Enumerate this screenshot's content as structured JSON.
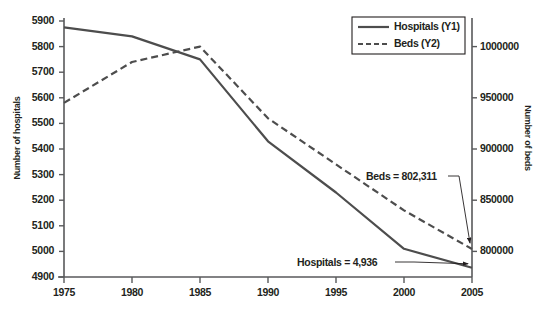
{
  "chart_data": {
    "type": "line",
    "title": "",
    "xlabel": "",
    "ylabel": "Number of hospitals",
    "ylabel_secondary": "Number of beds",
    "grid": false,
    "legend_position": "top-right",
    "x": [
      1975,
      1980,
      1985,
      1990,
      1995,
      2000,
      2005
    ],
    "xtick_labels": [
      "1975",
      "1980",
      "1985",
      "1990",
      "1995",
      "2000",
      "2005"
    ],
    "xlim": [
      1975,
      2005
    ],
    "ylim": [
      4900,
      5900
    ],
    "ytick_labels": [
      "5900",
      "5800",
      "5700",
      "5600",
      "5500",
      "5400",
      "5300",
      "5200",
      "5100",
      "5000",
      "4900"
    ],
    "ytick_values": [
      5900,
      5800,
      5700,
      5600,
      5500,
      5400,
      5300,
      5200,
      5100,
      5000,
      4900
    ],
    "ylim_secondary": [
      775000,
      1025000
    ],
    "ytick_labels_secondary": [
      "1000000",
      "950000",
      "900000",
      "850000",
      "800000"
    ],
    "ytick_values_secondary": [
      1000000,
      950000,
      900000,
      850000,
      800000
    ],
    "series": [
      {
        "name": "Hospitals (Y1)",
        "axis": "left",
        "style": "solid",
        "color": "#4d4d4d",
        "values": [
          5875,
          5840,
          5750,
          5430,
          5230,
          5010,
          4936
        ]
      },
      {
        "name": "Beds (Y2)",
        "axis": "right",
        "style": "dashed",
        "color": "#4d4d4d",
        "values": [
          945000,
          985000,
          1000000,
          930000,
          885000,
          840000,
          802311
        ]
      }
    ],
    "annotations": [
      {
        "text": "Beds = 802,311",
        "target_x": 2005,
        "target_series": "Beds (Y2)"
      },
      {
        "text": "Hospitals = 4,936",
        "target_x": 2005,
        "target_series": "Hospitals (Y1)"
      }
    ]
  },
  "legend": {
    "items": [
      {
        "label": "Hospitals (Y1)",
        "style": "solid"
      },
      {
        "label": "Beds (Y2)",
        "style": "dashed"
      }
    ]
  },
  "axes": {
    "left_title": "Number of hospitals",
    "right_title": "Number of beds"
  }
}
